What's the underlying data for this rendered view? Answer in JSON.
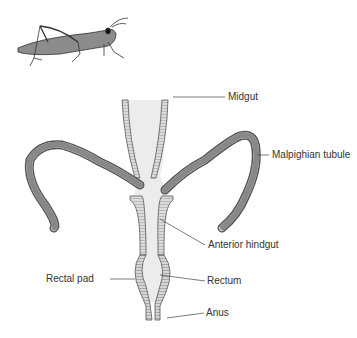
{
  "diagram": {
    "labels": {
      "midgut": "Midgut",
      "malpighian_tubule": "Malpighian tubule",
      "anterior_hindgut": "Anterior hindgut",
      "rectal_pad": "Rectal pad",
      "rectum": "Rectum",
      "anus": "Anus"
    },
    "colors": {
      "lumen_fill": "#ececec",
      "wall_stroke": "#555555",
      "wall_fill": "#d8d8d8",
      "leader_line": "#444444",
      "label_text": "#333333"
    },
    "icons": {
      "organism": "grasshopper-illustration"
    }
  }
}
